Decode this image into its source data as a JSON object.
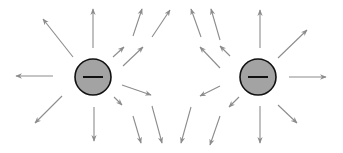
{
  "diagram": {
    "title": "",
    "colors": {
      "arrow": "#8c8c8c",
      "charge_fill": "#a3a3a3",
      "charge_outline": "#111111",
      "background": "#ffffff"
    },
    "charges": [
      {
        "id": "left-charge",
        "sign": "negative",
        "symbol": "−",
        "cx": 93,
        "cy": 77,
        "r": 18
      },
      {
        "id": "right-charge",
        "sign": "negative",
        "symbol": "−",
        "cx": 258,
        "cy": 77,
        "r": 18
      }
    ],
    "arrows": [
      {
        "x1": 73,
        "y1": 57,
        "x2": 43,
        "y2": 19
      },
      {
        "x1": 93,
        "y1": 48,
        "x2": 93,
        "y2": 9
      },
      {
        "x1": 113,
        "y1": 57,
        "x2": 124,
        "y2": 47
      },
      {
        "x1": 123,
        "y1": 66,
        "x2": 143,
        "y2": 47
      },
      {
        "x1": 133,
        "y1": 36,
        "x2": 142,
        "y2": 9
      },
      {
        "x1": 152,
        "y1": 37,
        "x2": 170,
        "y2": 10
      },
      {
        "x1": 53,
        "y1": 76,
        "x2": 16,
        "y2": 76
      },
      {
        "x1": 62,
        "y1": 96,
        "x2": 35,
        "y2": 123
      },
      {
        "x1": 122,
        "y1": 85,
        "x2": 151,
        "y2": 95
      },
      {
        "x1": 114,
        "y1": 97,
        "x2": 122,
        "y2": 105
      },
      {
        "x1": 94,
        "y1": 107,
        "x2": 94,
        "y2": 141
      },
      {
        "x1": 133,
        "y1": 116,
        "x2": 141,
        "y2": 143
      },
      {
        "x1": 152,
        "y1": 106,
        "x2": 162,
        "y2": 143
      },
      {
        "x1": 201,
        "y1": 37,
        "x2": 191,
        "y2": 9
      },
      {
        "x1": 220,
        "y1": 40,
        "x2": 211,
        "y2": 9
      },
      {
        "x1": 220,
        "y1": 68,
        "x2": 200,
        "y2": 47
      },
      {
        "x1": 230,
        "y1": 56,
        "x2": 220,
        "y2": 46
      },
      {
        "x1": 260,
        "y1": 48,
        "x2": 260,
        "y2": 10
      },
      {
        "x1": 278,
        "y1": 58,
        "x2": 307,
        "y2": 30
      },
      {
        "x1": 289,
        "y1": 77,
        "x2": 326,
        "y2": 77
      },
      {
        "x1": 220,
        "y1": 86,
        "x2": 200,
        "y2": 96
      },
      {
        "x1": 239,
        "y1": 97,
        "x2": 229,
        "y2": 107
      },
      {
        "x1": 191,
        "y1": 107,
        "x2": 181,
        "y2": 143
      },
      {
        "x1": 220,
        "y1": 116,
        "x2": 210,
        "y2": 145
      },
      {
        "x1": 260,
        "y1": 106,
        "x2": 260,
        "y2": 143
      },
      {
        "x1": 278,
        "y1": 105,
        "x2": 297,
        "y2": 123
      }
    ]
  }
}
